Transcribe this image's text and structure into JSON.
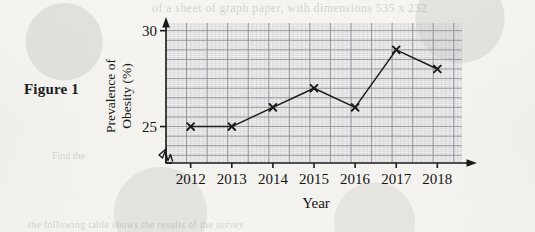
{
  "figure": {
    "caption": "Figure 1"
  },
  "ghost_text": {
    "top": "of a sheet of graph paper, with dimensions 535 x 232",
    "bottom": "the following table shows the results of the survey",
    "left": "Find the"
  },
  "chart_data": {
    "type": "line",
    "title": "",
    "xlabel": "Year",
    "ylabel": "Prevalence of Obesity (%)",
    "ylabel_lines": [
      "Prevalence of",
      "Obesity (%)"
    ],
    "categories": [
      "2012",
      "2013",
      "2014",
      "2015",
      "2016",
      "2017",
      "2018"
    ],
    "x": [
      2012,
      2013,
      2014,
      2015,
      2016,
      2017,
      2018
    ],
    "values": [
      25,
      25,
      26,
      27,
      26,
      29,
      28
    ],
    "ylim": [
      23.1,
      30.4
    ],
    "xlim": [
      2011.4,
      2018.6
    ],
    "y_tick_labels": [
      "25",
      "30"
    ],
    "y_ticks": [
      25,
      30
    ],
    "grid": true,
    "grid_minor_step": 0.1,
    "grid_major_step": 0.5,
    "legend": "none",
    "marker": "x",
    "axis_break": true,
    "series_color": "#1a1a1a",
    "grid_major_color": "#8d8d96",
    "grid_minor_color": "#c8c9d2",
    "axis_color": "#1a1a1a"
  }
}
